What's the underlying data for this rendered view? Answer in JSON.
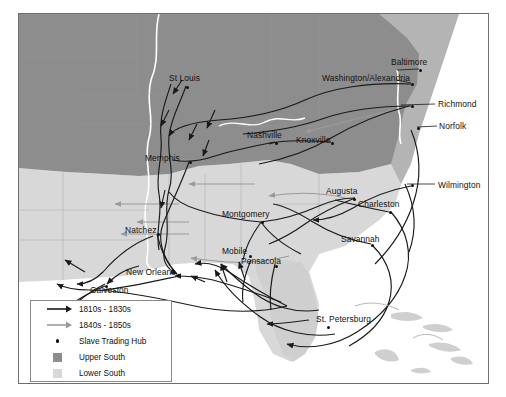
{
  "map": {
    "title": "Domestic Slave Trade Routes Map",
    "frame": {
      "x": 18,
      "y": 13,
      "w": 469,
      "h": 369
    },
    "colors": {
      "upper_south": "#8d8d8d",
      "lower_south": "#d8d8d8",
      "other_land": "#b4b4b4",
      "water": "#ffffff",
      "route_early": "#1a1a1a",
      "route_late": "#9a9a9a",
      "border": "#6f6f6f",
      "label_text": "#111111"
    },
    "cities": [
      {
        "name": "St Louis",
        "lx": 150,
        "ly": 60,
        "dx": 167,
        "dy": 72,
        "anchor": "start"
      },
      {
        "name": "Baltimore",
        "lx": 372,
        "ly": 44,
        "dx": 400,
        "dy": 55,
        "anchor": "start"
      },
      {
        "name": "Washington/Alexandria",
        "lx": 303,
        "ly": 60,
        "dx": 392,
        "dy": 69,
        "anchor": "start"
      },
      {
        "name": "Richmond",
        "lx": 419,
        "ly": 86,
        "dx": 392,
        "dy": 91,
        "anchor": "start"
      },
      {
        "name": "Norfolk",
        "lx": 420,
        "ly": 108,
        "dx": 398,
        "dy": 113,
        "anchor": "start"
      },
      {
        "name": "Nashville",
        "lx": 228,
        "ly": 117,
        "dx": 256,
        "dy": 128,
        "anchor": "start"
      },
      {
        "name": "Knoxville",
        "lx": 277,
        "ly": 122,
        "dx": 312,
        "dy": 128,
        "anchor": "start"
      },
      {
        "name": "Memphis",
        "lx": 126,
        "ly": 140,
        "dx": 170,
        "dy": 147,
        "anchor": "start"
      },
      {
        "name": "Wilmington",
        "lx": 419,
        "ly": 167,
        "dx": 392,
        "dy": 170,
        "anchor": "start"
      },
      {
        "name": "Augusta",
        "lx": 307,
        "ly": 173,
        "dx": 334,
        "dy": 184,
        "anchor": "start"
      },
      {
        "name": "Charleston",
        "lx": 339,
        "ly": 186,
        "dx": 370,
        "dy": 197,
        "anchor": "start"
      },
      {
        "name": "Montgomery",
        "lx": 203,
        "ly": 196,
        "dx": 242,
        "dy": 207,
        "anchor": "start"
      },
      {
        "name": "Natchez",
        "lx": 106,
        "ly": 212,
        "dx": 138,
        "dy": 219,
        "anchor": "start"
      },
      {
        "name": "Savannah",
        "lx": 322,
        "ly": 221,
        "dx": 352,
        "dy": 230,
        "anchor": "start"
      },
      {
        "name": "Mobile",
        "lx": 203,
        "ly": 233,
        "dx": 230,
        "dy": 241,
        "anchor": "start"
      },
      {
        "name": "Pensacola",
        "lx": 222,
        "ly": 243,
        "dx": 256,
        "dy": 251,
        "anchor": "start"
      },
      {
        "name": "New Orleans",
        "lx": 107,
        "ly": 254,
        "dx": 158,
        "dy": 260,
        "anchor": "start"
      },
      {
        "name": "Galveston",
        "lx": 71,
        "ly": 272,
        "dx": 86,
        "dy": 271,
        "anchor": "start"
      },
      {
        "name": "St. Petersburg",
        "lx": 297,
        "ly": 301,
        "dx": 308,
        "dy": 312,
        "anchor": "start"
      }
    ],
    "legend": {
      "items": [
        {
          "label": "1810s - 1830s",
          "type": "arrow",
          "color": "#1a1a1a"
        },
        {
          "label": "1840s - 1850s",
          "type": "arrow",
          "color": "#9a9a9a"
        },
        {
          "label": "Slave Trading Hub",
          "type": "dot",
          "color": "#111111"
        },
        {
          "label": "Upper South",
          "type": "swatch",
          "color": "#8d8d8d"
        },
        {
          "label": "Lower South",
          "type": "swatch",
          "color": "#d8d8d8"
        }
      ]
    }
  }
}
